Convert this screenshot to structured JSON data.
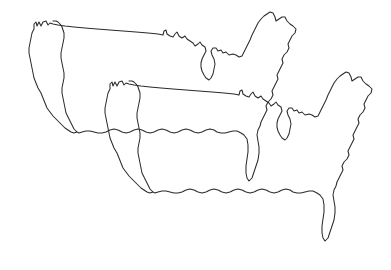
{
  "document": {
    "title": "Overlapping United States Outline Maps",
    "type": "line-art-diagram",
    "width": 391,
    "height": 270,
    "background_color": "#ffffff",
    "stroke_color": "#2b2b2b",
    "stroke_width": 1.05,
    "fill": "none",
    "visible_text": [],
    "description": "Two identical outline maps of the contiguous United States, drawn as thin dark line art with no fill, overlapping. The second copy is offset down and to the right of the first."
  },
  "shapes": [
    {
      "name": "us-outline-upper-left",
      "label": "United States outline (upper-left copy)",
      "offset_x": 0,
      "offset_y": 0,
      "stroke_color": "#2b2b2b",
      "path": "M33,29 L34,24 L37,26 L39,23 L41,27 L44,23 L47,22 L49,25 L54,24 L62,25 L74,26 L90,28 L110,30 L132,32 L151,34 L162,35 L163,31 L166,33 L168,37 L174,38 L176,34 L179,37 L183,36 L186,40 L190,41 L193,45 L197,44 L200,48 L203,46 L205,50 L203,55 L201,60 L202,66 L204,72 L206,78 L209,80 L212,77 L214,71 L215,64 L213,58 L211,54 L213,50 L216,49 L219,52 L222,50 L224,54 L228,53 L231,56 L236,54 L240,57 L243,55 L246,51 L248,46 L250,41 L252,36 L254,31 L256,26 L258,21 L261,18 L264,15 L267,13 L270,11 L273,12 L275,16 L277,20 L280,18 L283,16 L286,17 L288,21 L291,24 L294,26 L296,30 L294,34 L291,37 L289,41 L287,45 L288,49 L286,53 L283,56 L281,60 L283,64 L281,68 L278,71 L276,75 L278,79 L276,83 L273,86 L271,90 L272,94 L270,98 L267,101 L265,105 L266,109 L264,113 L261,116 L259,120 L260,124 L258,128 L256,133 L257,139 L258,146 L259,153 L258,160 L256,167 L254,173 L252,178 L249,180 L247,177 L246,172 L246,165 L247,158 L248,151 L248,144 L246,138 L243,134 L239,132 L235,131 L231,132 L227,133 L223,133 L219,132 L215,131 L211,131 L207,132 L203,133 L199,133 L195,132 L191,131 L187,131 L183,132 L179,133 L175,133 L171,132 L167,131 L163,131 L159,132 L155,133 L151,133 L147,132 L143,131 L139,131 L135,132 L131,133 L127,133 L123,132 L119,131 L115,131 L111,132 L107,133 L103,133 L99,132 L95,131 L91,131 L87,132 L83,133 L79,133 L76,132 L74,128 L72,124 L70,120 L68,116 L66,112 L65,107 L64,102 L63,97 L62,92 L62,87 L63,82 L64,77 L64,72 L63,67 L62,62 L61,57 L61,52 L62,47 L63,42 L64,37 L64,33 L63,29 L62,26 L61,23 L60,21 L59,19 M33,29 L32,33 L31,38 L30,43 L29,48 L28,53 L28,58 L29,63 L30,68 L31,73 L32,78 L33,83 L34,88 L35,93 L36,98 L38,103 L40,108 L43,112 L46,116 L49,119 L52,122 L55,125 L58,128 L61,130 L64,132 L67,133 L70,133 L73,133 L76,132",
      "path_simplified": true
    },
    {
      "name": "us-outline-lower-right",
      "label": "United States outline (lower-right copy)",
      "offset_x": 75,
      "offset_y": 58,
      "stroke_color": "#2b2b2b",
      "path": "same-shape-translated",
      "path_simplified": true
    }
  ],
  "geometry_notes": {
    "upper_map_bounds": {
      "x": 27,
      "y": 19,
      "width": 272,
      "height": 163
    },
    "lower_map_bounds": {
      "x": 104,
      "y": 78,
      "width": 272,
      "height": 176
    },
    "offset_between_copies": {
      "dx": 76,
      "dy": 60
    },
    "intersection_point": {
      "x": 105,
      "y": 157
    }
  }
}
